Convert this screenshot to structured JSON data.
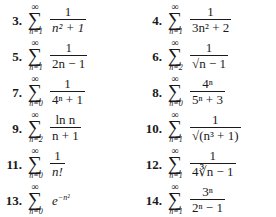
{
  "sigma_symbol": "∑",
  "infinity_symbol": "∞",
  "problems": [
    {
      "number": "3.",
      "lower": "n=1",
      "numerator": "1",
      "denominator": "n² + 1"
    },
    {
      "number": "4.",
      "lower": "n=1",
      "numerator": "1",
      "denominator": "3n² + 2"
    },
    {
      "number": "5.",
      "lower": "n=1",
      "numerator": "1",
      "denominator": "2n − 1"
    },
    {
      "number": "6.",
      "lower": "n=2",
      "numerator": "1",
      "denominator": "√n − 1"
    },
    {
      "number": "7.",
      "lower": "n=0",
      "numerator": "1",
      "denominator": "4ⁿ + 1"
    },
    {
      "number": "8.",
      "lower": "n=0",
      "numerator": "4ⁿ",
      "denominator": "5ⁿ + 3"
    },
    {
      "number": "9.",
      "lower": "n=2",
      "numerator": "ln n",
      "denominator": "n + 1"
    },
    {
      "number": "10.",
      "lower": "n=1",
      "numerator": "1",
      "denominator": "√(n³ + 1)"
    },
    {
      "number": "11.",
      "lower": "n=0",
      "numerator": "1",
      "denominator": "n!"
    },
    {
      "number": "12.",
      "lower": "n=1",
      "numerator": "1",
      "denominator": "4∛n − 1"
    },
    {
      "number": "13.",
      "lower": "n=0",
      "expression": "e",
      "exponent": "−n²"
    },
    {
      "number": "14.",
      "lower": "n=1",
      "numerator": "3ⁿ",
      "denominator": "2ⁿ − 1"
    }
  ]
}
